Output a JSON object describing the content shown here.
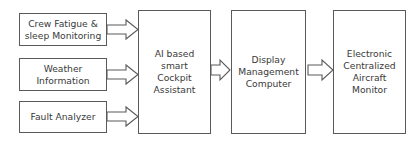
{
  "diagram": {
    "inputs": [
      {
        "id": "crew-fatigue",
        "label": "Crew Fatigue &\nsleep Monitoring"
      },
      {
        "id": "weather",
        "label": "Weather\nInformation"
      },
      {
        "id": "fault",
        "label": "Fault Analyzer"
      }
    ],
    "processor": {
      "label": "AI based\nsmart\nCockpit\nAssistant"
    },
    "display": {
      "label": "Display\nManagement\nComputer"
    },
    "output": {
      "label": "Electronic\nCentralized\nAircraft\nMonitor"
    },
    "edges": [
      {
        "from": "Crew Fatigue & sleep Monitoring",
        "to": "AI based smart Cockpit Assistant"
      },
      {
        "from": "Weather Information",
        "to": "AI based smart Cockpit Assistant"
      },
      {
        "from": "Fault Analyzer",
        "to": "AI based smart Cockpit Assistant"
      },
      {
        "from": "AI based smart Cockpit Assistant",
        "to": "Display Management Computer"
      },
      {
        "from": "Display Management Computer",
        "to": "Electronic Centralized Aircraft Monitor"
      }
    ],
    "colors": {
      "stroke": "#5a5a5a",
      "text": "#3a3a3a",
      "background": "#ffffff"
    }
  }
}
